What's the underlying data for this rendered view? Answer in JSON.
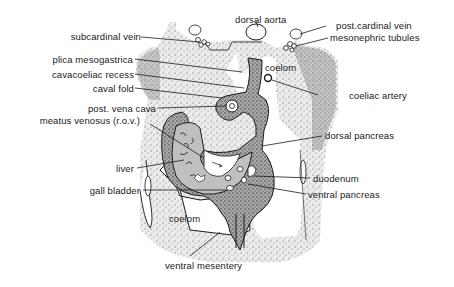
{
  "figure": {
    "type": "anatomical cross-section diagram",
    "colors": {
      "ink": "#1a1a1a",
      "stipple_light": "#d8d8d8",
      "stipple_dark": "#8a8a8a",
      "background": "#ffffff"
    },
    "labels": {
      "dorsal_aorta": "dorsal aorta",
      "subcardinal_vein": "subcardinal vein",
      "post_cardinal_vein": "post.cardinal vein",
      "mesonephric_tubules": "mesonephric tubules",
      "plica_mesogastrica": "plica mesogastrica",
      "cavacoeliac_recess": "cavacoeliac recess",
      "caval_fold": "caval fold",
      "coelom_upper": "coelom",
      "coeliac_artery": "coeliac artery",
      "post_vena_cava": "post. vena cava",
      "meatus_venosus": "meatus venosus  (r.o.v.)",
      "dorsal_pancreas": "dorsal pancreas",
      "liver": "liver",
      "duodenum": "duodenum",
      "gall_bladder": "gall bladder",
      "ventral_pancreas": "ventral pancreas",
      "coelom_lower": "coelom",
      "ventral_mesentery": "ventral mesentery"
    }
  }
}
